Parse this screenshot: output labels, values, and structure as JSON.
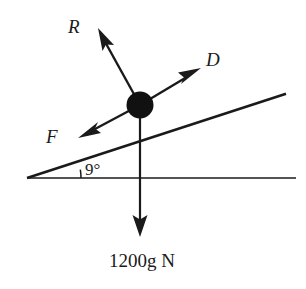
{
  "figure": {
    "kind": "free-body-diagram",
    "background_color": "#ffffff",
    "ink_color": "#1a1a1a"
  },
  "incline": {
    "angle_label": "9°",
    "angle_degrees": 9
  },
  "vectors": [
    {
      "name": "normal-reaction",
      "label": "R",
      "direction": "up-left perpendicular to incline"
    },
    {
      "name": "driving-force",
      "label": "D",
      "direction": "up the slope"
    },
    {
      "name": "friction-force",
      "label": "F",
      "direction": "down the slope"
    },
    {
      "name": "weight",
      "label": "1200g N",
      "direction": "vertically downward"
    }
  ],
  "labels": {
    "reaction": "R",
    "driving": "D",
    "friction": "F",
    "weight": "1200g N",
    "angle": "9°"
  }
}
